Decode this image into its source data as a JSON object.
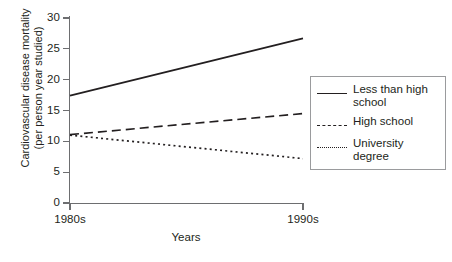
{
  "chart_data": {
    "type": "line",
    "title": "",
    "xlabel": "Years",
    "ylabel": "Cardiovascular disease mortality (per person year studied)",
    "ylabel_line1": "Cardiovascular disease mortality",
    "ylabel_line2": "(per person year studied)",
    "x": [
      "1980s",
      "1990s"
    ],
    "xticklabels": [
      "1980s",
      "1990s"
    ],
    "yticklabels": [
      "0",
      "5",
      "10",
      "15",
      "20",
      "25",
      "30"
    ],
    "ytickvalues": [
      0,
      5,
      10,
      15,
      20,
      25,
      30
    ],
    "ylim": [
      0,
      30
    ],
    "grid": false,
    "legend_position": "right-outside",
    "series": [
      {
        "name": "Less than high school",
        "style": "solid",
        "color": "#231f20",
        "values": [
          17.4,
          26.7
        ]
      },
      {
        "name": "High school",
        "style": "dashed",
        "color": "#231f20",
        "values": [
          11.1,
          14.5
        ]
      },
      {
        "name": "University degree",
        "style": "dotted",
        "color": "#231f20",
        "values": [
          11.0,
          7.2
        ]
      }
    ]
  },
  "legend": {
    "entries": [
      {
        "label": "Less than high school",
        "style": "solid"
      },
      {
        "label": "High school",
        "style": "dashed"
      },
      {
        "label": "University degree",
        "style": "dotted"
      }
    ]
  }
}
